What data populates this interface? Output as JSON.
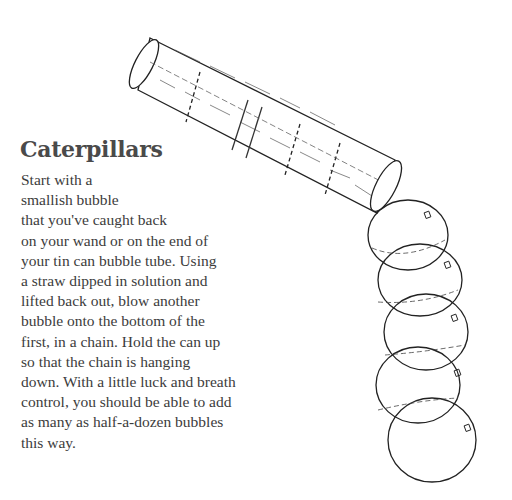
{
  "heading": "Caterpillars",
  "body_lines": [
    "Start with a",
    "smallish bubble",
    "that you've caught back",
    "on your wand or on the end of",
    "your tin can bubble tube. Using",
    "a straw dipped in solution and",
    "lifted back out, blow another",
    "bubble onto the bottom of the",
    "first, in a chain. Hold the can up",
    "so that the chain is hanging",
    "down. With a little luck and breath",
    "control, you should be able to add",
    "as many as half-a-dozen bubbles",
    "this way."
  ],
  "illustration": {
    "subject": "tin can bubble tube with chain of bubbles",
    "bubble_count": 5
  }
}
